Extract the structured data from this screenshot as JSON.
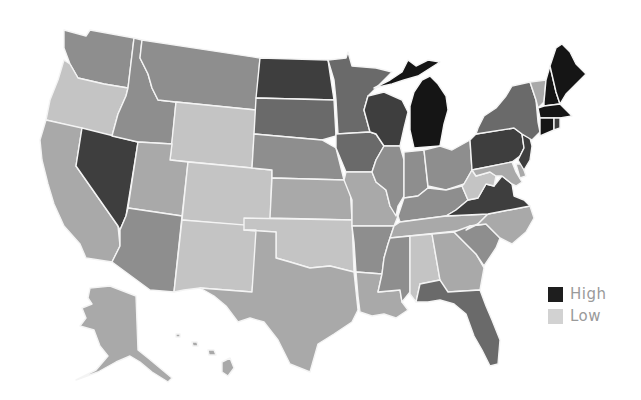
{
  "map": {
    "title": "",
    "type": "choropleth",
    "region": "United States",
    "palette": {
      "lvl1": "#c4c4c4",
      "lvl2": "#a9a9a9",
      "lvl3": "#8e8e8e",
      "lvl4": "#6a6a6a",
      "lvl5": "#3e3e3e",
      "lvl6": "#151515"
    },
    "states": [
      {
        "id": "WA",
        "level": 3
      },
      {
        "id": "OR",
        "level": 1
      },
      {
        "id": "CA",
        "level": 2
      },
      {
        "id": "NV",
        "level": 5
      },
      {
        "id": "ID",
        "level": 3
      },
      {
        "id": "MT",
        "level": 3
      },
      {
        "id": "WY",
        "level": 1
      },
      {
        "id": "UT",
        "level": 2
      },
      {
        "id": "AZ",
        "level": 3
      },
      {
        "id": "CO",
        "level": 1
      },
      {
        "id": "NM",
        "level": 1
      },
      {
        "id": "ND",
        "level": 5
      },
      {
        "id": "SD",
        "level": 4
      },
      {
        "id": "NE",
        "level": 3
      },
      {
        "id": "KS",
        "level": 2
      },
      {
        "id": "OK",
        "level": 1
      },
      {
        "id": "TX",
        "level": 2
      },
      {
        "id": "MN",
        "level": 4
      },
      {
        "id": "IA",
        "level": 4
      },
      {
        "id": "MO",
        "level": 2
      },
      {
        "id": "AR",
        "level": 3
      },
      {
        "id": "LA",
        "level": 2
      },
      {
        "id": "WI",
        "level": 5
      },
      {
        "id": "IL",
        "level": 3
      },
      {
        "id": "MI",
        "level": 6
      },
      {
        "id": "IN",
        "level": 3
      },
      {
        "id": "OH",
        "level": 3
      },
      {
        "id": "KY",
        "level": 3
      },
      {
        "id": "TN",
        "level": 2
      },
      {
        "id": "MS",
        "level": 3
      },
      {
        "id": "AL",
        "level": 1
      },
      {
        "id": "GA",
        "level": 2
      },
      {
        "id": "FL",
        "level": 4
      },
      {
        "id": "SC",
        "level": 3
      },
      {
        "id": "NC",
        "level": 2
      },
      {
        "id": "VA",
        "level": 5
      },
      {
        "id": "WV",
        "level": 1
      },
      {
        "id": "PA",
        "level": 5
      },
      {
        "id": "NY",
        "level": 4
      },
      {
        "id": "VT",
        "level": 2
      },
      {
        "id": "NH",
        "level": 6
      },
      {
        "id": "ME",
        "level": 6
      },
      {
        "id": "MA",
        "level": 6
      },
      {
        "id": "CT",
        "level": 6
      },
      {
        "id": "RI",
        "level": 5
      },
      {
        "id": "NJ",
        "level": 5
      },
      {
        "id": "DE",
        "level": 2
      },
      {
        "id": "MD",
        "level": 2
      },
      {
        "id": "AK",
        "level": 2
      },
      {
        "id": "HI",
        "level": 2
      }
    ]
  },
  "legend": {
    "items": [
      {
        "label": "High",
        "color": "#1e1e1e"
      },
      {
        "label": "Low",
        "color": "#d2d2d2"
      }
    ]
  }
}
